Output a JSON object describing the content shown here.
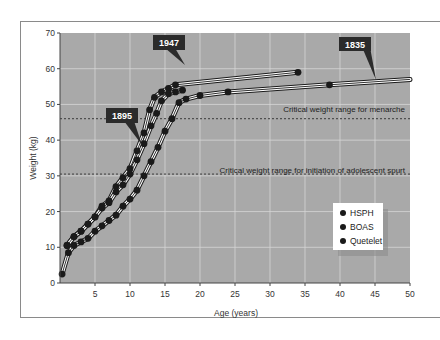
{
  "chart_data": {
    "type": "line",
    "title": "",
    "xlabel": "Age (years)",
    "ylabel": "Weight (kg)",
    "xlim": [
      0,
      50
    ],
    "ylim": [
      0,
      70
    ],
    "x_ticks": [
      5,
      10,
      15,
      20,
      25,
      30,
      35,
      40,
      45,
      50
    ],
    "y_ticks": [
      0,
      10,
      20,
      30,
      40,
      50,
      60,
      70
    ],
    "grid": true,
    "legend_position": "lower-right",
    "legend": [
      "HSPH",
      "BOAS",
      "Quetelet"
    ],
    "series": [
      {
        "name": "1947",
        "points": [
          [
            1,
            10.5
          ],
          [
            2,
            13
          ],
          [
            3,
            14.5
          ],
          [
            4,
            16.5
          ],
          [
            5,
            18.5
          ],
          [
            6,
            21.5
          ],
          [
            7,
            23
          ],
          [
            8,
            27
          ],
          [
            9,
            29.5
          ],
          [
            10,
            32
          ],
          [
            11,
            37
          ],
          [
            12,
            42
          ],
          [
            12.8,
            48.5
          ],
          [
            13.5,
            52
          ],
          [
            14.5,
            53.5
          ],
          [
            15.5,
            54.5
          ],
          [
            16.5,
            55.5
          ],
          [
            34,
            59
          ]
        ]
      },
      {
        "name": "1895",
        "points": [
          [
            1,
            10.5
          ],
          [
            2,
            13
          ],
          [
            3,
            14.5
          ],
          [
            4,
            16.5
          ],
          [
            5,
            18.5
          ],
          [
            6,
            21
          ],
          [
            7,
            22.5
          ],
          [
            8,
            25.5
          ],
          [
            9,
            27.5
          ],
          [
            10,
            30.5
          ],
          [
            11,
            34.5
          ],
          [
            12,
            39
          ],
          [
            13,
            44
          ],
          [
            13.8,
            47.5
          ],
          [
            14.5,
            51
          ],
          [
            15.5,
            53
          ],
          [
            16.5,
            53.5
          ],
          [
            17.5,
            54
          ]
        ]
      },
      {
        "name": "1835",
        "points": [
          [
            0.3,
            2.5
          ],
          [
            1.2,
            8.5
          ],
          [
            2,
            10.5
          ],
          [
            3,
            11.5
          ],
          [
            4,
            12.5
          ],
          [
            5,
            14.5
          ],
          [
            6,
            16
          ],
          [
            7,
            17.5
          ],
          [
            8,
            19
          ],
          [
            9,
            21.5
          ],
          [
            10,
            23.5
          ],
          [
            11,
            26
          ],
          [
            12,
            30
          ],
          [
            13,
            34
          ],
          [
            14,
            38
          ],
          [
            15,
            42.5
          ],
          [
            16,
            46
          ],
          [
            17,
            50.5
          ],
          [
            18,
            51.5
          ],
          [
            20,
            52.5
          ],
          [
            24,
            53.5
          ],
          [
            38.5,
            55.5
          ],
          [
            50,
            57
          ]
        ]
      }
    ],
    "annotations": [
      {
        "text": "Critical weight range for menarche",
        "y": 46,
        "style": "dashed"
      },
      {
        "text": "Critical weight range for initiation of adolescent spurt",
        "y": 30.5,
        "style": "dashed"
      }
    ],
    "callouts": [
      "1947",
      "1895",
      "1835"
    ]
  },
  "labels": {
    "xlabel": "Age (years)",
    "ylabel": "Weight (kg)",
    "menarche": "Critical weight range for menarche",
    "spurt": "Critical weight range for initiation of adolescent spurt",
    "y1947": "1947",
    "y1895": "1895",
    "y1835": "1835",
    "legend_hsph": "HSPH",
    "legend_boas": "BOAS",
    "legend_quetelet": "Quetelet"
  },
  "ticks": {
    "x": [
      "5",
      "10",
      "15",
      "20",
      "25",
      "30",
      "35",
      "40",
      "45",
      "50"
    ],
    "y": [
      "0",
      "10",
      "20",
      "30",
      "40",
      "50",
      "60",
      "70"
    ]
  },
  "colors": {
    "plot_bg": "#a9a9a9",
    "grid": "#d6d6d6",
    "curve": "#1a1a1a",
    "curve_halo": "#ffffff",
    "dot": "#1a1a1a",
    "callout_bg": "#2b2b2b",
    "dash": "#3a3a3a"
  }
}
